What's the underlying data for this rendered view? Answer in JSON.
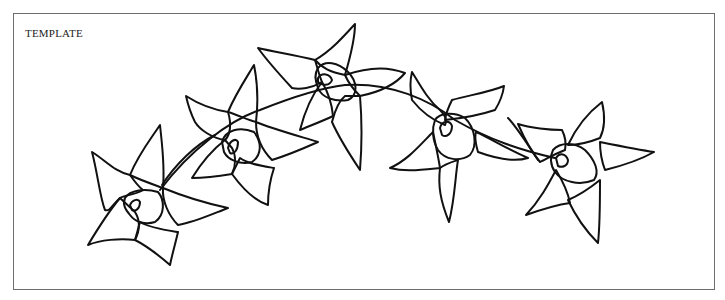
{
  "label": "TEMPLATE",
  "figure": {
    "flower_count": 5,
    "line_color": "#111111",
    "frame_color": "#6e6e6e",
    "background": "#ffffff"
  }
}
